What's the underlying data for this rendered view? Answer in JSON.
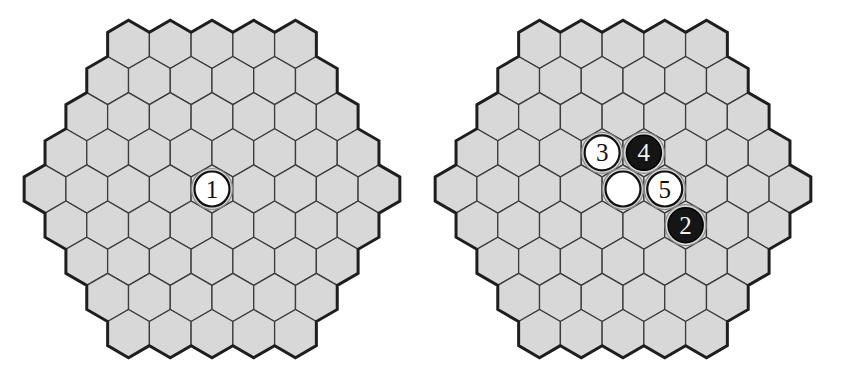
{
  "colors": {
    "cell_fill": "#d8d8d8",
    "cell_line": "#3c3c3c",
    "border": "#1e1e1e",
    "white_stone": "#ffffff",
    "black_stone": "#151515"
  },
  "board_side": 5,
  "boards": [
    {
      "name": "board-left",
      "center": [
        212,
        189
      ],
      "hex_radius": 24.1,
      "stones": [
        {
          "q": 0,
          "r": 0,
          "color": "white",
          "label": "1"
        }
      ]
    },
    {
      "name": "board-right",
      "center": [
        623,
        189
      ],
      "hex_radius": 24.1,
      "stones": [
        {
          "q": 0,
          "r": 0,
          "color": "white",
          "label": ""
        },
        {
          "q": 1,
          "r": 1,
          "color": "black",
          "label": "2"
        },
        {
          "q": 0,
          "r": -1,
          "color": "white",
          "label": "3"
        },
        {
          "q": 1,
          "r": -1,
          "color": "black",
          "label": "4"
        },
        {
          "q": 1,
          "r": 0,
          "color": "white",
          "label": "5"
        }
      ]
    }
  ]
}
